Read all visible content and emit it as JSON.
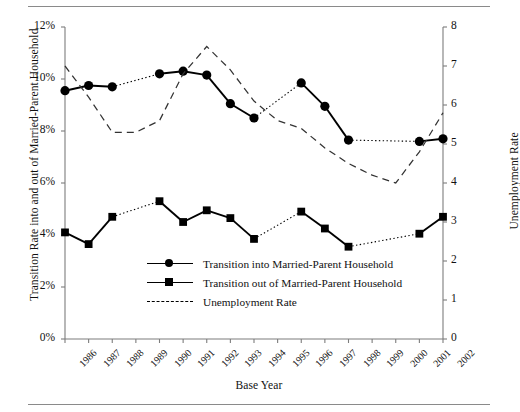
{
  "chart_data": {
    "type": "line",
    "title": "",
    "xlabel": "Base Year",
    "ylabel": "Transition Rate into and out of Married-Parent Household",
    "ylabel_right": "Unemployment Rate",
    "categories": [
      "1986",
      "1987",
      "1988",
      "1989",
      "1990",
      "1991",
      "1992",
      "1993",
      "1994",
      "1995",
      "1996",
      "1997",
      "1998",
      "1999",
      "2000",
      "2001",
      "2002"
    ],
    "ylim": [
      0,
      12
    ],
    "ylim_right": [
      0,
      8
    ],
    "yticks": [
      "0%",
      "2%",
      "4%",
      "6%",
      "8%",
      "10%",
      "12%"
    ],
    "yticks_right": [
      "0",
      "1",
      "2",
      "3",
      "4",
      "5",
      "6",
      "7",
      "8"
    ],
    "grid": false,
    "legend_position": "center-bottom-inside",
    "series": [
      {
        "name": "Transition into Married-Parent Household",
        "axis": "left",
        "marker": "circle",
        "linestyle": "solid-with-dotted-gaps",
        "values": [
          9.55,
          9.75,
          9.7,
          null,
          10.2,
          10.3,
          10.15,
          9.05,
          8.5,
          null,
          9.85,
          8.95,
          7.65,
          null,
          null,
          7.6,
          7.7
        ]
      },
      {
        "name": "Transition out of Married-Parent Household",
        "axis": "left",
        "marker": "square",
        "linestyle": "solid-with-dotted-gaps",
        "values": [
          4.1,
          3.65,
          4.7,
          null,
          5.3,
          4.5,
          4.95,
          4.65,
          3.85,
          null,
          4.9,
          4.25,
          3.55,
          null,
          null,
          4.05,
          4.7
        ]
      },
      {
        "name": "Unemployment Rate",
        "axis": "right",
        "marker": "none",
        "linestyle": "dashed",
        "values": [
          7.0,
          6.2,
          5.3,
          5.3,
          5.6,
          6.8,
          7.5,
          6.9,
          6.1,
          5.6,
          5.4,
          4.9,
          4.5,
          4.2,
          4.0,
          4.8,
          5.8
        ]
      }
    ],
    "legend": [
      {
        "label": "Transition into Married-Parent Household",
        "key": "line-circle"
      },
      {
        "label": "Transition out of Married-Parent Household",
        "key": "line-square"
      },
      {
        "label": "Unemployment Rate",
        "key": "dashed-line"
      }
    ]
  }
}
